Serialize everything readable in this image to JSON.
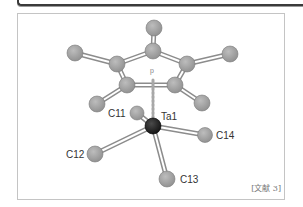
{
  "figure": {
    "reference_label": "[文献 3]",
    "centroid_marker": "p",
    "colors": {
      "carbon_atom": "#a6a6a6",
      "carbon_outline": "#7a7a7a",
      "metal_atom": "#262626",
      "bond": "#8c8c8c",
      "frame": "#c4c4c4",
      "label": "#333333"
    },
    "atoms": [
      {
        "id": "C11",
        "label": "C11",
        "type": "C",
        "x": 137,
        "y": 113
      },
      {
        "id": "Ta1",
        "label": "Ta1",
        "type": "Ta",
        "x": 153,
        "y": 126
      },
      {
        "id": "C12",
        "label": "C12",
        "type": "C",
        "x": 95,
        "y": 154
      },
      {
        "id": "C13",
        "label": "C13",
        "type": "C",
        "x": 167,
        "y": 179
      },
      {
        "id": "C14",
        "label": "C14",
        "type": "C",
        "x": 205,
        "y": 135
      }
    ],
    "labels": {
      "c11": "C11",
      "ta1": "Ta1",
      "c12": "C12",
      "c13": "C13",
      "c14": "C14"
    }
  }
}
